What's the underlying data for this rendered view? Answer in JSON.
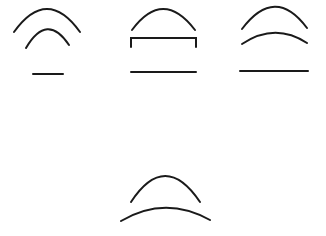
{
  "diagram": {
    "background": "#ffffff",
    "stroke_color": "#1a1a1a",
    "figures": [
      {
        "id": "figure-1",
        "description": "outer arc, smaller inner arc, short horizontal line",
        "paths": [
          {
            "name": "outer-arc",
            "d": "M14,32 Q47,-14 80,32"
          },
          {
            "name": "inner-arc",
            "d": "M26,48 Q47,12 69,45"
          },
          {
            "name": "baseline",
            "d": "M33,74 L63,74"
          }
        ]
      },
      {
        "id": "figure-2",
        "description": "arc above a bracket, long horizontal line",
        "paths": [
          {
            "name": "arc",
            "d": "M132,30 Q163,-12 195,30"
          },
          {
            "name": "bracket",
            "d": "M131,47 L131,38 L196,38 L196,47"
          },
          {
            "name": "baseline",
            "d": "M131,72 L196,72"
          }
        ]
      },
      {
        "id": "figure-3",
        "description": "outer arc, flatter inner arc, long horizontal line",
        "paths": [
          {
            "name": "outer-arc",
            "d": "M242,29 Q275,-15 307,28"
          },
          {
            "name": "inner-arc",
            "d": "M242,44 Q275,22 307,43"
          },
          {
            "name": "baseline",
            "d": "M240,71 L308,71"
          }
        ]
      },
      {
        "id": "figure-4",
        "description": "upper arc over a wider flatter arc",
        "paths": [
          {
            "name": "upper-arc",
            "d": "M131,202 Q165,150 200,202"
          },
          {
            "name": "lower-arc",
            "d": "M121,221 Q165,195 210,220"
          }
        ]
      }
    ]
  }
}
